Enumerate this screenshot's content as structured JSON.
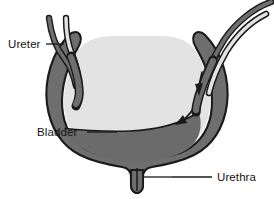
{
  "diagram": {
    "type": "anatomical-illustration",
    "background_color": "#ffffff",
    "colors": {
      "outline": "#1a1a1a",
      "wall": "#6e6e6e",
      "lumen": "#e3e3e3",
      "urine": "#6b6b6b",
      "label_text": "#141414",
      "leader_line": "#1a1a1a"
    },
    "labels": [
      {
        "id": "ureter",
        "text": "Ureter",
        "position": "left",
        "leader_line": {
          "from_x": 46,
          "from_y": 44,
          "to_x": 64,
          "to_y": 44
        },
        "points_to": "left-ureter-tube"
      },
      {
        "id": "bladder",
        "text": "Bladder",
        "position": "left",
        "leader_line": {
          "from_x": 87,
          "from_y": 132,
          "to_x": 117,
          "to_y": 132
        },
        "points_to": "bladder-urine-region"
      },
      {
        "id": "urethra",
        "text": "Urethra",
        "position": "right",
        "leader_line": {
          "from_x": 172,
          "from_y": 177,
          "to_x": 212,
          "to_y": 177
        },
        "points_to": "urethra-tube"
      }
    ],
    "structures": [
      {
        "id": "left-ureter",
        "name": "Left ureter",
        "has_flow_arrow": false
      },
      {
        "id": "right-ureter",
        "name": "Right ureter",
        "has_flow_arrow": true
      },
      {
        "id": "bladder-wall",
        "name": "Bladder wall"
      },
      {
        "id": "bladder-lumen",
        "name": "Bladder lumen"
      },
      {
        "id": "urine",
        "name": "Urine"
      },
      {
        "id": "urethra",
        "name": "Urethra"
      }
    ],
    "flow_arrows": [
      {
        "id": "ureter-inflow-arrow",
        "direction": "down",
        "location": "right ureter entering bladder"
      },
      {
        "id": "urine-surface-arrow",
        "direction": "down-left",
        "location": "urine level inside bladder"
      }
    ]
  }
}
